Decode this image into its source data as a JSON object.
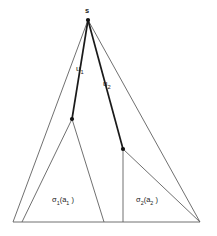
{
  "figure": {
    "background_color": "#ffffff",
    "stroke_color": "#555555",
    "bold_stroke_color": "#1a1a1a",
    "node_color": "#111111",
    "width": 217,
    "height": 236,
    "apex_label": "s",
    "edge_labels": [
      {
        "id": "u1",
        "base": "u",
        "subscript": "1"
      },
      {
        "id": "u2",
        "base": "u",
        "subscript": "2"
      }
    ],
    "region_labels": [
      {
        "id": "sigma1",
        "prefix": "σ",
        "prefix_sub": "1",
        "open": "(a",
        "arg_sub": "1",
        "close": " )"
      },
      {
        "id": "sigma2",
        "prefix": "σ",
        "prefix_sub": "2",
        "open": "(a",
        "arg_sub": "2",
        "close": " )"
      }
    ],
    "points": {
      "apex": {
        "x": 88,
        "y": 20
      },
      "node_u1": {
        "x": 72,
        "y": 119
      },
      "node_u2": {
        "x": 123,
        "y": 149
      },
      "base_left": {
        "x": 13,
        "y": 222
      },
      "base_right": {
        "x": 200,
        "y": 222
      },
      "base_left_inner": {
        "x": 22,
        "y": 222
      },
      "base_mid_left": {
        "x": 104,
        "y": 222
      },
      "base_mid_right": {
        "x": 123,
        "y": 222
      }
    }
  }
}
